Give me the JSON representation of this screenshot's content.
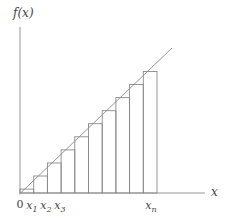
{
  "figure": {
    "labels": {
      "y_axis": "f(x)",
      "x_axis": "x",
      "origin": "0",
      "ticks": [
        {
          "base": "x",
          "sub": "1"
        },
        {
          "base": "x",
          "sub": "2"
        },
        {
          "base": "x",
          "sub": "3"
        },
        {
          "base": "x",
          "sub": "n"
        }
      ]
    },
    "colors": {
      "stroke": "#8a8a8a",
      "text": "#454545",
      "background": "#ffffff"
    },
    "geometry": {
      "canvas": {
        "width": 231,
        "height": 223
      },
      "origin": {
        "x": 20,
        "y": 193
      },
      "y_axis_top": 27,
      "x_axis_end": 205,
      "function_line": {
        "x1": 19,
        "y1": 194.5,
        "x2": 172,
        "y2": 48
      },
      "num_rectangles": 10,
      "rect_width": 13.7,
      "rect_tops": [
        189.1,
        176.0,
        163.0,
        149.9,
        136.8,
        123.7,
        110.7,
        97.6,
        84.5,
        71.5
      ]
    }
  }
}
